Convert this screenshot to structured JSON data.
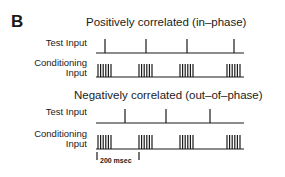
{
  "panel": {
    "letter": "B"
  },
  "sections": [
    {
      "title": "Positively correlated (in–phase)",
      "test_label": "Test Input",
      "conditioning_label_line1": "Conditioning",
      "conditioning_label_line2": "Input",
      "test_spike_x": [
        105,
        146,
        187,
        234
      ],
      "burst_start_x": [
        98,
        139,
        180,
        227
      ]
    },
    {
      "title": "Negatively correlated (out–of–phase)",
      "test_label": "Test Input",
      "conditioning_label_line1": "Conditioning",
      "conditioning_label_line2": "Input",
      "test_spike_x": [
        125,
        166,
        210
      ],
      "burst_start_x": [
        98,
        139,
        180,
        227
      ]
    }
  ],
  "scale_bar": {
    "label": "200 msec"
  },
  "colors": {
    "ink": "#1a1a1a",
    "background": "#ffffff"
  }
}
